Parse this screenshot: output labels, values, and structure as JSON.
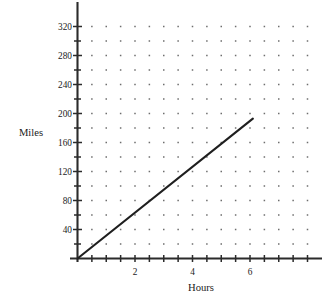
{
  "chart_data": {
    "type": "line",
    "title": "",
    "subtitle": "",
    "xlabel": "Hours",
    "ylabel": "Miles",
    "xlim": [
      0,
      8.4
    ],
    "ylim": [
      0,
      338
    ],
    "grid": "dotted",
    "grid_style": "dot-lattice",
    "legend": "none",
    "x_tick_labels": [
      "2",
      "4",
      "6"
    ],
    "x_tick_values": [
      2,
      4,
      6
    ],
    "x_minor_tick_step": 0.5,
    "y_tick_labels": [
      "40",
      "80",
      "120",
      "160",
      "200",
      "240",
      "280",
      "320"
    ],
    "y_tick_values": [
      40,
      80,
      120,
      160,
      200,
      240,
      280,
      320
    ],
    "y_minor_tick_step": 20,
    "series": [
      {
        "name": "distance",
        "x": [
          0,
          6.1
        ],
        "values": [
          0,
          193
        ],
        "slope_miles_per_hour": 32,
        "color": "#1f1f1f"
      }
    ],
    "points": [
      {
        "x": 0,
        "y": 0
      },
      {
        "x": 1,
        "y": 32
      },
      {
        "x": 2,
        "y": 64
      },
      {
        "x": 3,
        "y": 96
      },
      {
        "x": 4,
        "y": 128
      },
      {
        "x": 5,
        "y": 160
      },
      {
        "x": 6,
        "y": 192
      }
    ],
    "colors": {
      "axis": "#2b2b2b",
      "grid_dot": "#6e6e6e",
      "line": "#1f1f1f",
      "text": "#1a1a1a",
      "background": "#ffffff"
    }
  },
  "labels": {
    "y_axis_title": "Miles",
    "x_axis_title": "Hours",
    "y_320": "320",
    "y_280": "280",
    "y_240": "240",
    "y_200": "200",
    "y_160": "160",
    "y_120": "120",
    "y_80": "80",
    "y_40": "40",
    "x_2": "2",
    "x_4": "4",
    "x_6": "6"
  }
}
